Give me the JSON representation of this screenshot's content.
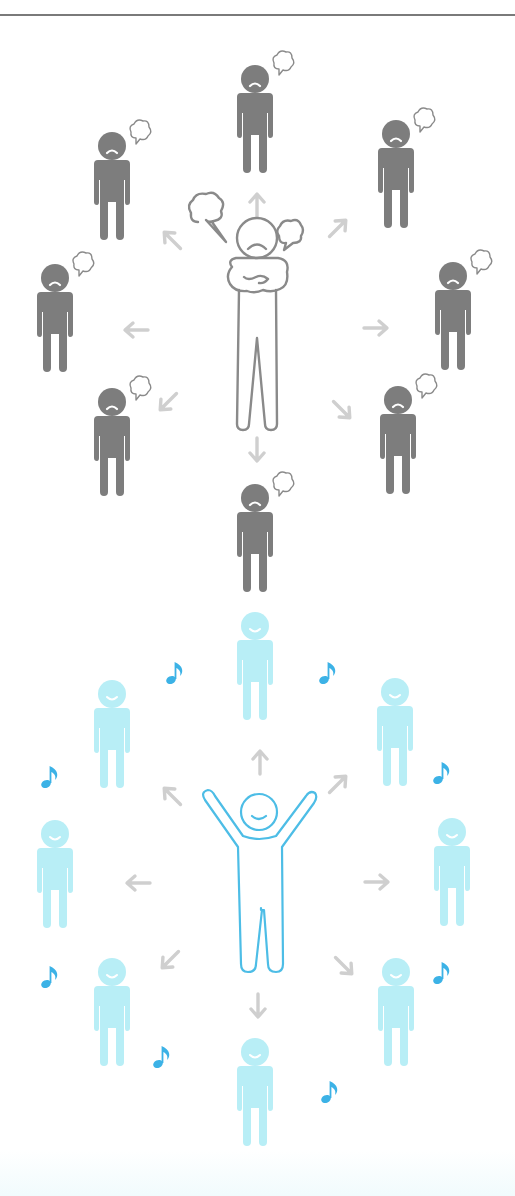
{
  "illustration": {
    "title": "Negative vs positive emotional influence on surrounding people",
    "colors": {
      "divider": "#7a7a7a",
      "negative_person": "#7d7d7d",
      "negative_outline": "#8a8a8a",
      "arrow": "#cfcfcf",
      "positive_person": "#b8eef6",
      "positive_outline": "#4dbde6",
      "music_note": "#3cb2e6"
    },
    "top_panel": {
      "name": "angry-center-person",
      "center": {
        "expression": "frown",
        "pose": "arms-crossed",
        "speech_bubbles": 2
      },
      "surrounding_people": 8,
      "surrounding_expression": "frown",
      "surrounding_accessory": "thought-bubble",
      "arrows": 8
    },
    "bottom_panel": {
      "name": "happy-center-person",
      "center": {
        "expression": "smile",
        "pose": "arms-raised"
      },
      "surrounding_people": 8,
      "surrounding_expression": "smile",
      "surrounding_accessory": "music-note",
      "arrows": 8,
      "music_notes": 8
    }
  }
}
